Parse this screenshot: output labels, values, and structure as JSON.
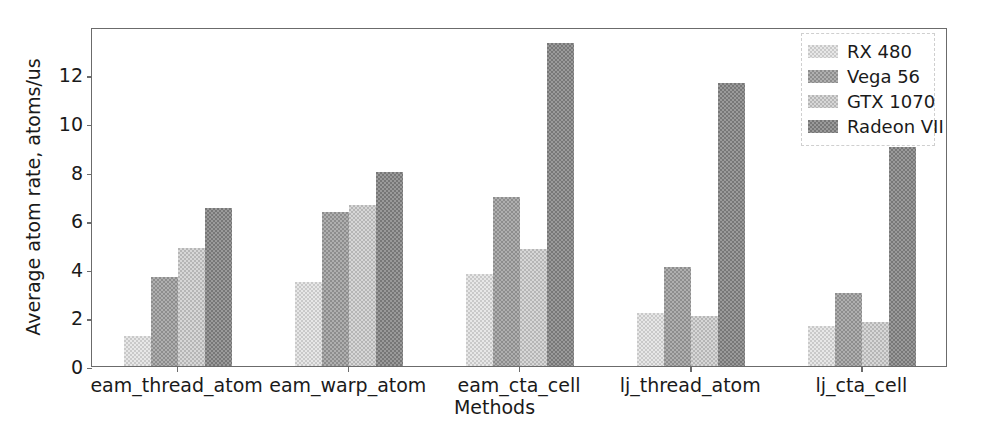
{
  "chart_data": {
    "type": "bar",
    "title": "",
    "xlabel": "Methods",
    "ylabel": "Average atom rate, atoms/us",
    "categories": [
      "eam_thread_atom",
      "eam_warp_atom",
      "eam_cta_cell",
      "lj_thread_atom",
      "lj_cta_cell"
    ],
    "series": [
      {
        "name": "RX 480",
        "color": "#c9c9c9",
        "values": [
          1.23,
          3.45,
          3.78,
          2.18,
          1.65
        ]
      },
      {
        "name": "Vega 56",
        "color": "#8d8d8d",
        "values": [
          3.66,
          6.33,
          6.95,
          4.07,
          3.0
        ]
      },
      {
        "name": "GTX 1070",
        "color": "#b6b6b6",
        "values": [
          4.85,
          6.62,
          4.81,
          2.05,
          1.81
        ]
      },
      {
        "name": "Radeon VII",
        "color": "#777777",
        "values": [
          6.52,
          7.98,
          13.28,
          11.65,
          9.0
        ]
      }
    ],
    "ylim": [
      0,
      13.95
    ],
    "yticks": [
      0,
      2,
      4,
      6,
      8,
      10,
      12
    ],
    "ytick_labels": [
      "0",
      "2",
      "4",
      "6",
      "8",
      "10",
      "12"
    ],
    "grid": false,
    "legend_position": "upper right"
  },
  "legend": {
    "entries": [
      {
        "label": "RX 480"
      },
      {
        "label": "Vega 56"
      },
      {
        "label": "GTX 1070"
      },
      {
        "label": "Radeon VII"
      }
    ]
  },
  "axes": {
    "x_title": "Methods",
    "y_title": "Average atom rate, atoms/us"
  }
}
